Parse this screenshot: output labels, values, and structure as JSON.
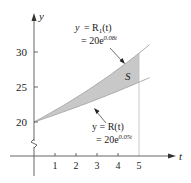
{
  "chart_data": {
    "type": "area",
    "title": "",
    "xlabel": "t",
    "ylabel": "y",
    "x_ticks": [
      "1",
      "2",
      "3",
      "4",
      "5"
    ],
    "y_ticks": [
      "20",
      "25",
      "30"
    ],
    "xlim": [
      -1.1,
      6.5
    ],
    "ylim": [
      15,
      34
    ],
    "y_axis_break": true,
    "grid": false,
    "series": [
      {
        "name": "R1(t) = 20e^{0.08t}",
        "formula": "20*exp(0.08*t)",
        "x": [
          0,
          1,
          2,
          3,
          4,
          5
        ],
        "values": [
          20.0,
          21.67,
          23.47,
          25.42,
          27.54,
          29.84
        ]
      },
      {
        "name": "R(t) = 20e^{0.05t}",
        "formula": "20*exp(0.05*t)",
        "x": [
          0,
          1,
          2,
          3,
          4,
          5
        ],
        "values": [
          20.0,
          21.03,
          22.1,
          23.24,
          24.43,
          25.68
        ]
      }
    ],
    "shaded_region": {
      "label": "S",
      "between": [
        "R1(t)",
        "R(t)"
      ],
      "t_range": [
        0,
        5
      ],
      "color": "#c8c8c8"
    },
    "annotations": [
      {
        "text_line1": "y = R",
        "sub": "1",
        "text_line1_end": "(t)",
        "text_line2": "= 20e",
        "exp": "0.08t",
        "points_to": "upper curve"
      },
      {
        "text_line1": "y = R(t)",
        "text_line2": "= 20e",
        "exp": "0.05t",
        "points_to": "lower curve"
      }
    ]
  },
  "labels": {
    "y_axis": "y",
    "x_axis": "t",
    "region": "S",
    "upper": {
      "l1a": "y",
      "l1b": "= R",
      "sub": "1",
      "l1c": "(t)",
      "l2": "= 20e",
      "exp": "0.08t"
    },
    "lower": {
      "l1": "y = R(t)",
      "l2": "= 20e",
      "exp": "0.05t"
    },
    "xticks": [
      "1",
      "2",
      "3",
      "4",
      "5"
    ],
    "yticks": [
      "30",
      "25",
      "20"
    ]
  },
  "colors": {
    "fill": "#c8c8c8",
    "curve": "#b5b5b5",
    "axis": "#555555"
  }
}
